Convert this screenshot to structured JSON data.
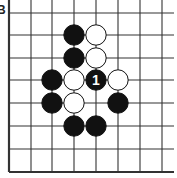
{
  "diagram": {
    "label": "B",
    "grid": {
      "x": [
        9,
        31,
        52,
        74,
        96,
        118,
        140,
        162
      ],
      "y": [
        13,
        35,
        58,
        80,
        103,
        126,
        149,
        172
      ],
      "extend_right": 174,
      "extend_top": 0,
      "edges": [
        "left",
        "bottom"
      ]
    },
    "stones": [
      {
        "col": 3,
        "row": 1,
        "color": "black"
      },
      {
        "col": 4,
        "row": 1,
        "color": "white"
      },
      {
        "col": 3,
        "row": 2,
        "color": "black"
      },
      {
        "col": 4,
        "row": 2,
        "color": "white"
      },
      {
        "col": 2,
        "row": 3,
        "color": "black"
      },
      {
        "col": 3,
        "row": 3,
        "color": "white"
      },
      {
        "col": 4,
        "row": 3,
        "color": "black",
        "label": "1"
      },
      {
        "col": 5,
        "row": 3,
        "color": "white"
      },
      {
        "col": 2,
        "row": 4,
        "color": "black"
      },
      {
        "col": 3,
        "row": 4,
        "color": "white"
      },
      {
        "col": 5,
        "row": 4,
        "color": "black"
      },
      {
        "col": 3,
        "row": 5,
        "color": "black"
      },
      {
        "col": 4,
        "row": 5,
        "color": "black"
      }
    ],
    "colors": {
      "line": "#333333",
      "black": "#111111",
      "white": "#ffffff",
      "stone_label": "#ffffff"
    }
  }
}
